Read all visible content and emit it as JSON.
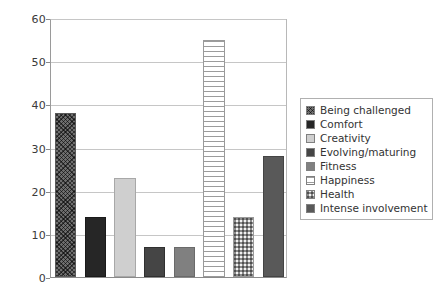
{
  "chart_data": {
    "type": "bar",
    "title": "",
    "xlabel": "",
    "ylabel": "",
    "ylim": [
      0,
      60
    ],
    "ytick_step": 10,
    "yticks": [
      "0",
      "10",
      "20",
      "30",
      "40",
      "50",
      "60"
    ],
    "grid": true,
    "legend_position": "right",
    "categories": [
      "Being challenged",
      "Comfort",
      "Creativity",
      "Evolving/maturing",
      "Fitness",
      "Happiness",
      "Health",
      "Intense involvement"
    ],
    "values": [
      38,
      14,
      23,
      7,
      7,
      55,
      14,
      28
    ],
    "series": [
      {
        "name": "",
        "values": [
          38,
          14,
          23,
          7,
          7,
          55,
          14,
          28
        ]
      }
    ],
    "bars": [
      {
        "label": "Being challenged",
        "value": 38,
        "pattern": "crosshatch-dark",
        "color": "#6e6e6e"
      },
      {
        "label": "Comfort",
        "value": 14,
        "pattern": "solid-verydark",
        "color": "#262626"
      },
      {
        "label": "Creativity",
        "value": 23,
        "pattern": "solid-light",
        "color": "#cfcfcf"
      },
      {
        "label": "Evolving/maturing",
        "value": 7,
        "pattern": "solid-darkgray",
        "color": "#454545"
      },
      {
        "label": "Fitness",
        "value": 7,
        "pattern": "solid-midgray",
        "color": "#808080"
      },
      {
        "label": "Happiness",
        "value": 55,
        "pattern": "hstripe",
        "color": "#ffffff"
      },
      {
        "label": "Health",
        "value": 14,
        "pattern": "checker-light",
        "color": "#f2f2f2"
      },
      {
        "label": "Intense involvement",
        "value": 28,
        "pattern": "solid-gray",
        "color": "#595959"
      }
    ]
  },
  "legend": {
    "items": [
      {
        "label": "Being challenged",
        "pattern": "crosshatch-dark"
      },
      {
        "label": "Comfort",
        "pattern": "solid-verydark"
      },
      {
        "label": "Creativity",
        "pattern": "solid-light"
      },
      {
        "label": "Evolving/maturing",
        "pattern": "solid-darkgray"
      },
      {
        "label": "Fitness",
        "pattern": "solid-midgray"
      },
      {
        "label": "Happiness",
        "pattern": "hstripe"
      },
      {
        "label": "Health",
        "pattern": "checker-light"
      },
      {
        "label": "Intense involvement",
        "pattern": "solid-gray"
      }
    ]
  }
}
